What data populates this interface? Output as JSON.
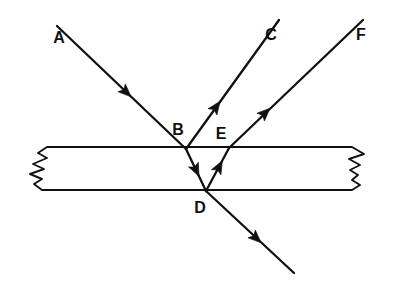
{
  "figure": {
    "type": "optics-ray-diagram",
    "background_color": "#ffffff",
    "line_color": "#111111",
    "width": 406,
    "height": 300
  },
  "slab": {
    "name": "glass-slab",
    "top_surface_y": 147,
    "bottom_surface_y": 190,
    "left_break_x": 18,
    "right_break_x": 388,
    "has_zigzag_break_left": true,
    "has_zigzag_break_right": true,
    "left_break_path": "M 122 147 L 47 147 L 38 153 L 47 158 L 33 164 L 44 169 L 30 174 L 42 179 L 34 184 L 42 190 L 120 190",
    "right_break_path": "M 290 147 L 352 147 L 364 154 L 349 159 L 360 165 L 350 170 L 358 175 L 352 180 L 360 185 L 352 190 L 290 190"
  },
  "labels": [
    {
      "id": "A",
      "text": "A",
      "x": 59,
      "y": 39
    },
    {
      "id": "B",
      "text": "B",
      "x": 178,
      "y": 131
    },
    {
      "id": "C",
      "text": "C",
      "x": 271,
      "y": 36
    },
    {
      "id": "D",
      "text": "D",
      "x": 200,
      "y": 209
    },
    {
      "id": "E",
      "text": "E",
      "x": 221,
      "y": 135
    },
    {
      "id": "F",
      "text": "F",
      "x": 361,
      "y": 36
    }
  ],
  "rays": [
    {
      "id": "incident-ray-A-to-B",
      "label": "A",
      "description": "Incident ray travelling down-right from A to point B on the top surface",
      "x1": 57,
      "y1": 26,
      "x2": 186,
      "y2": 149,
      "arrow": {
        "x": 126,
        "y": 92,
        "angle_deg": 43.6
      }
    },
    {
      "id": "reflected-ray-B-to-C",
      "label": "C",
      "description": "Ray reflected at B travelling up-right toward C",
      "x1": 186,
      "y1": 149,
      "x2": 279,
      "y2": 20,
      "arrow": {
        "x": 216,
        "y": 107,
        "angle_deg": -54.2
      }
    },
    {
      "id": "refracted-ray-B-to-D",
      "label": "BD",
      "description": "Refracted ray inside the slab travelling from B down-right to D on the bottom surface",
      "x1": 186,
      "y1": 149,
      "x2": 206,
      "y2": 191,
      "arrow": {
        "x": 196,
        "y": 170,
        "angle_deg": 64.5
      }
    },
    {
      "id": "internally-reflected-ray-D-to-E",
      "label": "DE",
      "description": "Internally reflected ray travelling from D up-right to E on the top surface",
      "x1": 206,
      "y1": 191,
      "x2": 229,
      "y2": 148,
      "arrow": {
        "x": 219,
        "y": 167,
        "angle_deg": -61.9
      }
    },
    {
      "id": "emergent-ray-E-to-F",
      "label": "F",
      "description": "Ray emerging at E travelling up-right toward F",
      "x1": 229,
      "y1": 148,
      "x2": 363,
      "y2": 20,
      "arrow": {
        "x": 265,
        "y": 113,
        "angle_deg": -43.7
      }
    },
    {
      "id": "transmitted-ray-D-downward",
      "label": "D-out",
      "description": "Ray transmitted through the bottom surface at D continuing down-right out of the slab",
      "x1": 206,
      "y1": 191,
      "x2": 294,
      "y2": 273,
      "arrow": {
        "x": 256,
        "y": 238,
        "angle_deg": 43.0
      }
    }
  ]
}
